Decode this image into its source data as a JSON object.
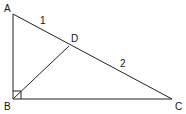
{
  "diagram": {
    "type": "right-triangle-with-altitude",
    "vertices": {
      "A": {
        "label": "A",
        "x": 13,
        "y": 14,
        "label_x": 4,
        "label_y": 12
      },
      "B": {
        "label": "B",
        "x": 13,
        "y": 99,
        "label_x": 4,
        "label_y": 110
      },
      "C": {
        "label": "C",
        "x": 172,
        "y": 99,
        "label_x": 175,
        "label_y": 110
      },
      "D": {
        "label": "D",
        "x": 69,
        "y": 46,
        "label_x": 71,
        "label_y": 42
      }
    },
    "segments": [
      {
        "from": "A",
        "to": "B"
      },
      {
        "from": "B",
        "to": "C"
      },
      {
        "from": "A",
        "to": "C"
      },
      {
        "from": "B",
        "to": "D"
      }
    ],
    "segment_labels": [
      {
        "segment": "AD",
        "text": "1",
        "x": 40,
        "y": 24
      },
      {
        "segment": "DC",
        "text": "2",
        "x": 120,
        "y": 67
      }
    ],
    "right_angle_marker": {
      "at": "B",
      "size": 8
    },
    "stroke_color": "#222222"
  }
}
